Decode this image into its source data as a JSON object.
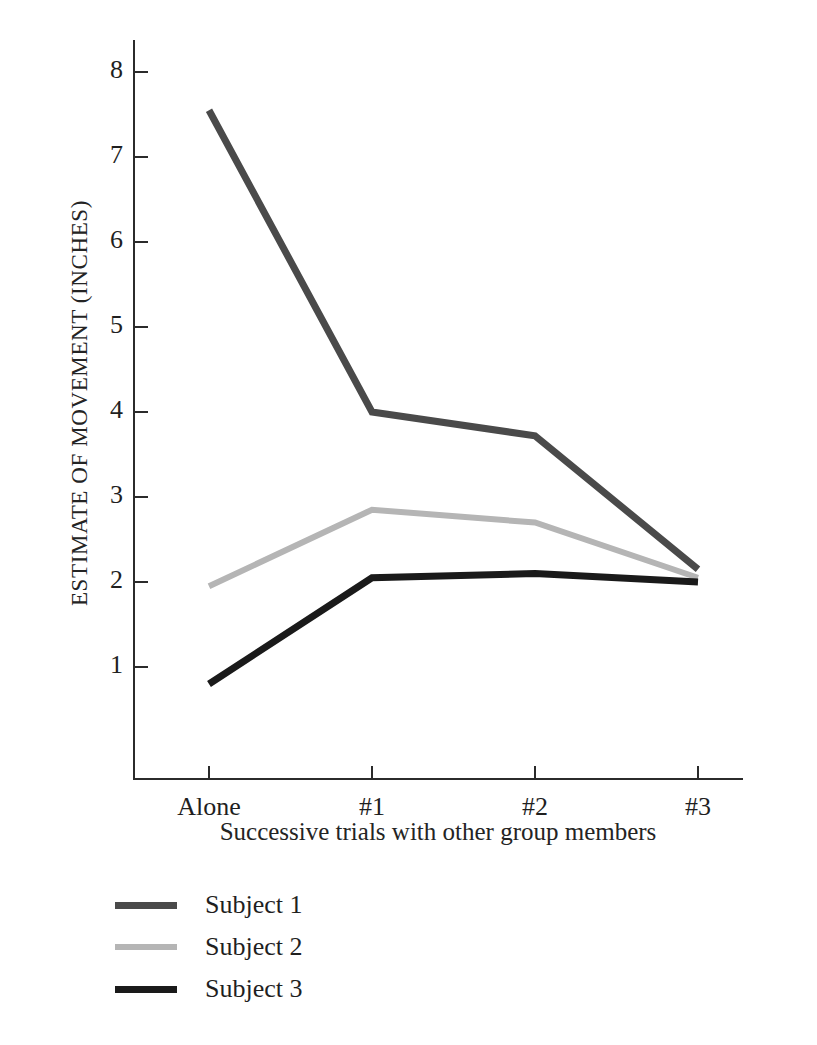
{
  "chart_data": {
    "type": "line",
    "title": "",
    "xlabel": "Successive trials with other group members",
    "ylabel": "ESTIMATE OF MOVEMENT (INCHES)",
    "categories": [
      "Alone",
      "#1",
      "#2",
      "#3"
    ],
    "yticks": [
      1,
      2,
      3,
      4,
      5,
      6,
      7,
      8
    ],
    "ylim": [
      0,
      8
    ],
    "grid": false,
    "legend_position": "below-left",
    "series": [
      {
        "name": "Subject 1",
        "color": "#4a4a4a",
        "values": [
          7.55,
          4.0,
          3.72,
          2.15
        ]
      },
      {
        "name": "Subject 2",
        "color": "#b5b5b5",
        "values": [
          1.95,
          2.85,
          2.7,
          2.05
        ]
      },
      {
        "name": "Subject 3",
        "color": "#1a1a1a",
        "values": [
          0.8,
          2.05,
          2.1,
          2.0
        ]
      }
    ]
  },
  "axis": {
    "ytick_labels": [
      "8",
      "7",
      "6",
      "5",
      "4",
      "3",
      "2",
      "1"
    ],
    "xtick_labels": [
      "Alone",
      "#1",
      "#2",
      "#3"
    ],
    "y_title": "ESTIMATE OF MOVEMENT (INCHES)",
    "x_title": "Successive trials with other group members"
  },
  "legend": {
    "items": [
      {
        "label": "Subject 1",
        "color": "#4a4a4a"
      },
      {
        "label": "Subject 2",
        "color": "#b5b5b5"
      },
      {
        "label": "Subject 3",
        "color": "#1a1a1a"
      }
    ]
  },
  "colors": {
    "axis": "#2b2b2b",
    "text": "#1f1f1f",
    "background": "#ffffff",
    "subject1": "#4a4a4a",
    "subject2": "#b5b5b5",
    "subject3": "#1a1a1a"
  }
}
